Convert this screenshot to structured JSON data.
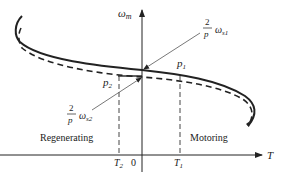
{
  "diagram": {
    "y_axis_label": "ω",
    "y_axis_sub": "m",
    "x_axis_label": "T",
    "origin_label": "0",
    "T1_label": "T",
    "T1_sub": "1",
    "T2_label": "T",
    "T2_sub": "2",
    "p1_label": "p",
    "p1_sub": "1",
    "p2_label": "p",
    "p2_sub": "2",
    "ws1": {
      "num": "2",
      "den": "p",
      "sym": "ω",
      "sub": "s1"
    },
    "ws2": {
      "num": "2",
      "den": "p",
      "sym": "ω",
      "sub": "s2"
    },
    "region_left": "Regenerating",
    "region_right": "Motoring",
    "colors": {
      "line": "#222222",
      "thin": "#555555"
    }
  }
}
